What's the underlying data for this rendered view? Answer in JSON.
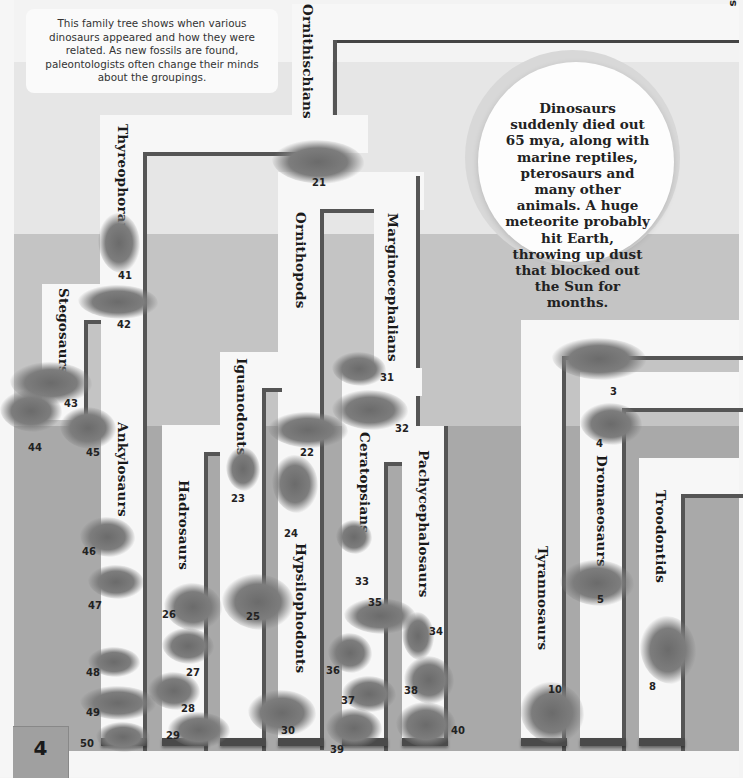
{
  "page": {
    "number": "4",
    "intro_text": "This family tree shows when various dinosaurs appeared and how they were related. As new fossils are found, paleontologists often change their minds about the groupings.",
    "callout_text": "Dinosaurs suddenly died out 65 mya, along with marine reptiles, pterosaurs and many other animals. A huge meteorite probably hit Earth, throwing up dust that blocked out the Sun for months.",
    "cutoff_label": "s"
  },
  "tree": {
    "groups": [
      {
        "id": "ornithischians",
        "label": "Ornithischians"
      },
      {
        "id": "thyreophorans",
        "label": "Thyreophorans"
      },
      {
        "id": "stegosaurs",
        "label": "Stegosaurs"
      },
      {
        "id": "ankylosaurs",
        "label": "Ankylosaurs"
      },
      {
        "id": "ornithopods",
        "label": "Ornithopods"
      },
      {
        "id": "iguanodonts",
        "label": "Iguanodonts"
      },
      {
        "id": "hadrosaurs",
        "label": "Hadrosaurs"
      },
      {
        "id": "hypsilophodonts",
        "label": "Hypsilophodonts"
      },
      {
        "id": "marginocephalians",
        "label": "Marginocephalians"
      },
      {
        "id": "ceratopsians",
        "label": "Ceratopsians"
      },
      {
        "id": "pachycephalosaurs",
        "label": "Pachycephalosaurs"
      },
      {
        "id": "tyrannosaurs",
        "label": "Tyrannosaurs"
      },
      {
        "id": "dromaeosaurs",
        "label": "Dromaeosaurs"
      },
      {
        "id": "troodontids",
        "label": "Troodontids"
      }
    ],
    "specimens": [
      "3",
      "4",
      "5",
      "8",
      "10",
      "21",
      "22",
      "23",
      "24",
      "25",
      "26",
      "27",
      "28",
      "29",
      "30",
      "31",
      "32",
      "33",
      "34",
      "35",
      "36",
      "37",
      "38",
      "39",
      "40",
      "41",
      "42",
      "43",
      "44",
      "45",
      "46",
      "47",
      "48",
      "49",
      "50"
    ]
  },
  "colors": {
    "band_light": "#f3f3f3",
    "band_mid_light": "#e6e6e6",
    "band_mid": "#c4c4c4",
    "band_dark": "#a9a9a9",
    "branch_white": "#f7f7f7",
    "branch_line": "#555555"
  }
}
